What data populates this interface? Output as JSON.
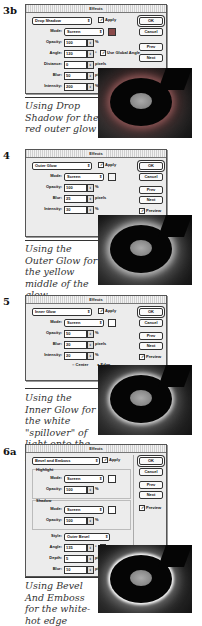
{
  "sections": [
    {
      "step": "3b",
      "dialog": {
        "title": "Effects",
        "effect": "Drop Shadow",
        "apply": "Apply",
        "mode_label": "Mode:",
        "mode": "Screen",
        "opacity_label": "Opacity:",
        "opacity": "100",
        "angle_label": "Angle:",
        "angle": "120",
        "angle_unit": "°",
        "global_light": "Use Global Angle",
        "distance_label": "Distance:",
        "distance": "0",
        "blur_label": "Blur:",
        "blur": "50",
        "intensity_label": "Intensity:",
        "intensity": "200",
        "pct": "%",
        "pixels": "pixels",
        "swatch_color": "#8a4a4a"
      },
      "caption": "Using Drop Shadow for the red outer glow"
    },
    {
      "step": "4",
      "dialog": {
        "title": "Effects",
        "effect": "Outer Glow",
        "apply": "Apply",
        "mode_label": "Mode:",
        "mode": "Screen",
        "opacity_label": "Opacity:",
        "opacity": "100",
        "blur_label": "Blur:",
        "blur": "25",
        "intensity_label": "Intensity:",
        "intensity": "30",
        "pct": "%",
        "pixels": "pixels",
        "swatch_color": "#f4f4f4"
      },
      "caption": "Using the Outer Glow for the yellow middle of the glow"
    },
    {
      "step": "5",
      "dialog": {
        "title": "Effects",
        "effect": "Inner Glow",
        "apply": "Apply",
        "mode_label": "Mode:",
        "mode": "Screen",
        "opacity_label": "Opacity:",
        "opacity": "50",
        "blur_label": "Blur:",
        "blur": "20",
        "intensity_label": "Intensity:",
        "intensity": "20",
        "pct": "%",
        "pixels": "pixels",
        "center": "Center",
        "edge": "Edge",
        "swatch_color": "#ffffff"
      },
      "caption": "Using the Inner Glow for the white \"spillover\" of light onto the graphic"
    },
    {
      "step": "6a",
      "dialog": {
        "title": "Effects",
        "effect": "Bevel and Emboss",
        "apply": "Apply",
        "highlight_title": "Highlight",
        "highlight_mode_label": "Mode:",
        "highlight_mode": "Screen",
        "highlight_opacity_label": "Opacity:",
        "highlight_opacity": "100",
        "shadow_title": "Shadow",
        "shadow_mode_label": "Mode:",
        "shadow_mode": "Screen",
        "shadow_opacity_label": "Opacity:",
        "shadow_opacity": "100",
        "style_label": "Style:",
        "style": "Outer Bevel",
        "angle_label": "Angle:",
        "angle": "135",
        "angle_unit": "°",
        "global_light": "Use Global Angle",
        "depth_label": "Depth:",
        "depth": "5",
        "blur_label": "Blur:",
        "blur": "10",
        "pct": "%",
        "pixels": "pixels",
        "swatch_color": "#ffffff"
      },
      "caption": "Using Bevel And Emboss for the white-hot edge"
    }
  ],
  "buttons": {
    "ok": "OK",
    "cancel": "Cancel",
    "prev": "Prev",
    "next": "Next",
    "preview": "Preview"
  },
  "glyphs": {
    "check": "✓",
    "arrow": "⇕",
    "radio_off": "○",
    "radio_on": "●"
  }
}
